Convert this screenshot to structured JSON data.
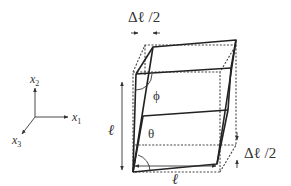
{
  "figure": {
    "type": "shear deformation of a cube",
    "axes": {
      "x1_label": "x",
      "x1_sub": "1",
      "x2_label": "x",
      "x2_sub": "2",
      "x3_label": "x",
      "x3_sub": "3"
    },
    "labels": {
      "top_displacement": "Δℓ /2",
      "right_displacement": "Δℓ /2",
      "height": "ℓ",
      "width": "ℓ",
      "angle_top": "ϕ",
      "angle_bottom": "θ"
    },
    "styles": {
      "line_color": "#222222",
      "dashed_color": "#444444",
      "background": "#ffffff"
    }
  }
}
